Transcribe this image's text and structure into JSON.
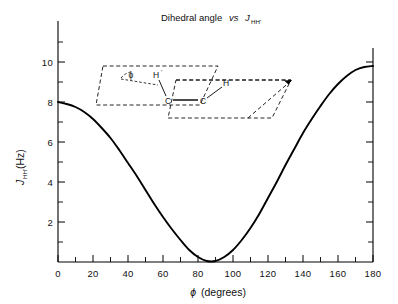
{
  "figure": {
    "title_part1": "Dihedral angle",
    "title_italic": "vs",
    "title_symbol": "J",
    "title_sub": "HH′",
    "background_color": "#ffffff",
    "line_color": "#000000",
    "axis_color": "#000000"
  },
  "axes": {
    "x": {
      "label_symbol": "ϕ",
      "label_unit": "(degrees)",
      "ticks": [
        "0",
        "20",
        "40",
        "60",
        "80",
        "100",
        "120",
        "140",
        "160",
        "180"
      ],
      "tick_values": [
        0,
        20,
        40,
        60,
        80,
        100,
        120,
        140,
        160,
        180
      ],
      "minor_step": 10,
      "min": 0,
      "max": 180
    },
    "y": {
      "label_symbol": "J",
      "label_sub": "HH′",
      "label_unit": "(Hz)",
      "ticks": [
        "2",
        "4",
        "6",
        "8",
        "10"
      ],
      "tick_values": [
        2,
        4,
        6,
        8,
        10
      ],
      "minor_step": 1,
      "min": 0,
      "max": 11.6
    }
  },
  "inset": {
    "angle_label": "ϕ",
    "atom_h_prime": "H",
    "atom_h_prime_sub": "′",
    "atom_h": "H",
    "atom_c_left": "C",
    "atom_c_right": "C"
  },
  "chart_data": {
    "type": "line",
    "xlabel": "ϕ (degrees)",
    "ylabel": "J_HH′ (Hz)",
    "xlim": [
      0,
      180
    ],
    "ylim": [
      0,
      11.6
    ],
    "grid": false,
    "legend": null,
    "series": [
      {
        "name": "J_HH′ (Karplus curve)",
        "x": [
          0,
          5,
          10,
          15,
          20,
          25,
          30,
          35,
          40,
          45,
          50,
          55,
          60,
          65,
          70,
          75,
          80,
          85,
          90,
          95,
          100,
          105,
          110,
          115,
          120,
          125,
          130,
          135,
          140,
          145,
          150,
          155,
          160,
          165,
          170,
          175,
          180
        ],
        "values": [
          8.0,
          7.9,
          7.75,
          7.5,
          7.15,
          6.7,
          6.2,
          5.6,
          4.95,
          4.3,
          3.6,
          2.9,
          2.25,
          1.65,
          1.1,
          0.6,
          0.25,
          0.05,
          0.05,
          0.25,
          0.6,
          1.1,
          1.7,
          2.4,
          3.2,
          4.0,
          4.85,
          5.65,
          6.45,
          7.15,
          7.8,
          8.4,
          8.9,
          9.3,
          9.6,
          9.75,
          9.8
        ]
      }
    ],
    "annotations": [
      {
        "text": "ϕ",
        "meaning": "dihedral angle in molecular inset"
      },
      {
        "text": "H′",
        "meaning": "hydrogen atom on left carbon"
      },
      {
        "text": "H",
        "meaning": "hydrogen atom on right carbon"
      },
      {
        "text": "C",
        "meaning": "left carbon"
      },
      {
        "text": "C",
        "meaning": "right carbon"
      }
    ]
  }
}
